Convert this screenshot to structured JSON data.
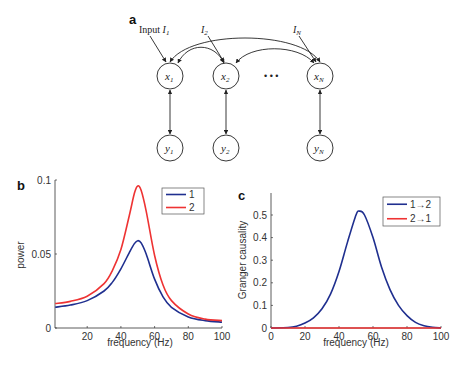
{
  "panel_a": {
    "label": "a",
    "input_labels": [
      {
        "prefix": "Input ",
        "var": "I",
        "sub": "1"
      },
      {
        "prefix": "",
        "var": "I",
        "sub": "2"
      },
      {
        "prefix": "",
        "var": "I",
        "sub": "N"
      }
    ],
    "x_nodes": [
      {
        "var": "x",
        "sub": "1"
      },
      {
        "var": "x",
        "sub": "2"
      },
      {
        "var": "x",
        "sub": "N"
      }
    ],
    "y_nodes": [
      {
        "var": "y",
        "sub": "1"
      },
      {
        "var": "y",
        "sub": "2"
      },
      {
        "var": "y",
        "sub": "N"
      }
    ],
    "ellipsis": "• • •"
  },
  "panel_b": {
    "label": "b"
  },
  "panel_c": {
    "label": "c"
  },
  "chart_data": [
    {
      "panel": "b",
      "type": "line",
      "title": "",
      "xlabel": "frequency (Hz)",
      "ylabel": "power",
      "xlim": [
        1,
        100
      ],
      "ylim": [
        0,
        0.1
      ],
      "xticks": [
        20,
        40,
        60,
        80,
        100
      ],
      "yticks": [
        0,
        0.05,
        0.1
      ],
      "ytick_labels": [
        "0",
        "0.05",
        "0.1"
      ],
      "grid": false,
      "legend_position": "upper right",
      "x": [
        1,
        10,
        20,
        30,
        35,
        40,
        45,
        48,
        50,
        52,
        55,
        60,
        65,
        70,
        80,
        90,
        100
      ],
      "series": [
        {
          "name": "1",
          "color": "#1f2f8f",
          "values": [
            0.014,
            0.0155,
            0.0185,
            0.025,
            0.031,
            0.04,
            0.051,
            0.057,
            0.059,
            0.0575,
            0.05,
            0.033,
            0.021,
            0.014,
            0.0075,
            0.005,
            0.004
          ]
        },
        {
          "name": "2",
          "color": "#ee3333",
          "values": [
            0.0165,
            0.018,
            0.0215,
            0.03,
            0.039,
            0.053,
            0.076,
            0.091,
            0.096,
            0.093,
            0.079,
            0.049,
            0.029,
            0.0185,
            0.0095,
            0.006,
            0.005
          ]
        }
      ]
    },
    {
      "panel": "c",
      "type": "line",
      "title": "",
      "xlabel": "frequency (Hz)",
      "ylabel": "Granger causality",
      "xlim": [
        0,
        100
      ],
      "ylim": [
        0,
        0.6
      ],
      "xticks": [
        0,
        20,
        40,
        60,
        80,
        100
      ],
      "yticks": [
        0,
        0.1,
        0.2,
        0.3,
        0.4,
        0.5
      ],
      "ytick_labels": [
        "0",
        "0.1",
        "0.2",
        "0.3",
        "0.4",
        "0.5"
      ],
      "grid": false,
      "legend_position": "upper right",
      "x": [
        0,
        10,
        15,
        20,
        25,
        30,
        35,
        40,
        45,
        50,
        52,
        55,
        60,
        65,
        70,
        75,
        80,
        85,
        90,
        95,
        100
      ],
      "series": [
        {
          "name": "1→2",
          "color": "#1f2f8f",
          "values": [
            0.0,
            0.002,
            0.008,
            0.022,
            0.045,
            0.085,
            0.15,
            0.25,
            0.38,
            0.5,
            0.517,
            0.5,
            0.4,
            0.27,
            0.17,
            0.1,
            0.055,
            0.025,
            0.01,
            0.003,
            0.0
          ]
        },
        {
          "name": "2→1",
          "color": "#ee3333",
          "values": [
            0.0,
            0.0,
            0.0,
            0.0,
            0.0,
            0.0,
            0.0,
            0.0,
            0.0,
            0.0,
            0.0,
            0.0,
            0.0,
            0.0,
            0.0,
            0.0,
            0.0,
            0.0,
            0.0,
            0.0,
            0.0
          ]
        }
      ]
    }
  ]
}
